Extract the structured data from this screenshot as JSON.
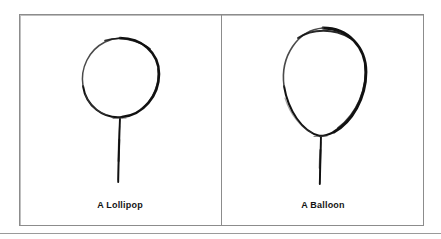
{
  "figure": {
    "type": "hand-drawn-sketch-comparison",
    "background_color": "#ffffff",
    "frame_color": "#8c8c8c",
    "ink_color": "#111111",
    "caption_color": "#141414",
    "panel_count": 2,
    "divider": "vertical-line",
    "page_rule": "horizontal-line"
  },
  "panels": [
    {
      "id": "panel-lollipop",
      "caption": "A Lollipop",
      "drawing": "circle-on-straight-stick",
      "shape_name": "circle",
      "stem_name": "stick"
    },
    {
      "id": "panel-balloon",
      "caption": "A Balloon",
      "drawing": "egg-shaped-oval-on-string",
      "shape_name": "oval",
      "stem_name": "string"
    }
  ]
}
